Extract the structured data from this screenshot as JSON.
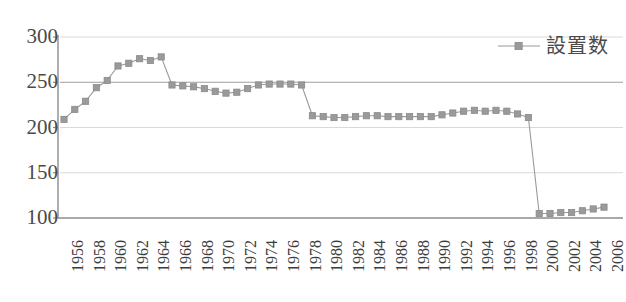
{
  "chart_data": {
    "type": "line",
    "title": "",
    "subtitle": "",
    "xlabel": "",
    "ylabel": "",
    "ylim": [
      100,
      300
    ],
    "xlim": [
      1956,
      2006
    ],
    "grid": true,
    "grid_orientation": "horizontal",
    "legend_position": "top-right",
    "marker": "square",
    "series": [
      {
        "name": "設置数",
        "color": "#9a9a9a",
        "x": [
          1956,
          1957,
          1958,
          1959,
          1960,
          1961,
          1962,
          1963,
          1964,
          1965,
          1966,
          1967,
          1968,
          1969,
          1970,
          1971,
          1972,
          1973,
          1974,
          1975,
          1976,
          1977,
          1978,
          1979,
          1980,
          1981,
          1982,
          1983,
          1984,
          1985,
          1986,
          1987,
          1988,
          1989,
          1990,
          1991,
          1992,
          1993,
          1994,
          1995,
          1996,
          1997,
          1998,
          1999,
          2000,
          2001,
          2002,
          2003,
          2004,
          2005,
          2006
        ],
        "values": [
          209,
          220,
          229,
          244,
          252,
          268,
          271,
          276,
          274,
          278,
          247,
          246,
          245,
          243,
          240,
          238,
          239,
          243,
          247,
          248,
          248,
          248,
          247,
          213,
          212,
          211,
          211,
          212,
          213,
          213,
          212,
          212,
          212,
          212,
          212,
          214,
          216,
          218,
          219,
          218,
          219,
          218,
          215,
          211,
          105,
          105,
          106,
          106,
          108,
          110,
          112
        ]
      }
    ],
    "yticks": [
      {
        "value": 300,
        "label": "300"
      },
      {
        "value": 250,
        "label": "250"
      },
      {
        "value": 200,
        "label": "200"
      },
      {
        "value": 150,
        "label": "150"
      },
      {
        "value": 100,
        "label": "100"
      }
    ],
    "xticks": [
      {
        "value": 1956,
        "label": "1956"
      },
      {
        "value": 1958,
        "label": "1958"
      },
      {
        "value": 1960,
        "label": "1960"
      },
      {
        "value": 1962,
        "label": "1962"
      },
      {
        "value": 1964,
        "label": "1964"
      },
      {
        "value": 1966,
        "label": "1966"
      },
      {
        "value": 1968,
        "label": "1968"
      },
      {
        "value": 1970,
        "label": "1970"
      },
      {
        "value": 1972,
        "label": "1972"
      },
      {
        "value": 1974,
        "label": "1974"
      },
      {
        "value": 1976,
        "label": "1976"
      },
      {
        "value": 1978,
        "label": "1978"
      },
      {
        "value": 1980,
        "label": "1980"
      },
      {
        "value": 1982,
        "label": "1982"
      },
      {
        "value": 1984,
        "label": "1984"
      },
      {
        "value": 1986,
        "label": "1986"
      },
      {
        "value": 1988,
        "label": "1988"
      },
      {
        "value": 1990,
        "label": "1990"
      },
      {
        "value": 1992,
        "label": "1992"
      },
      {
        "value": 1994,
        "label": "1994"
      },
      {
        "value": 1996,
        "label": "1996"
      },
      {
        "value": 1998,
        "label": "1998"
      },
      {
        "value": 2000,
        "label": "2000"
      },
      {
        "value": 2002,
        "label": "2002"
      },
      {
        "value": 2004,
        "label": "2004"
      },
      {
        "value": 2006,
        "label": "2006"
      }
    ]
  },
  "legend": {
    "entries": [
      {
        "label": "設置数",
        "color": "#9a9a9a",
        "marker": "square"
      }
    ]
  },
  "colors": {
    "series": "#9a9a9a",
    "axis": "#8c8c8c",
    "grid": "#d9d9d9",
    "tick_text": "#3c3c3c",
    "background": "#ffffff"
  }
}
